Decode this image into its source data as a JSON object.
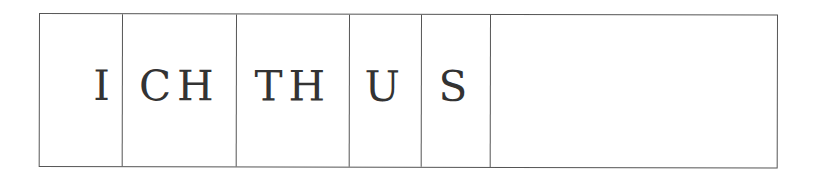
{
  "word": "ICHTHUS",
  "cells": [
    {
      "text": "I"
    },
    {
      "text": "CH"
    },
    {
      "text": "TH"
    },
    {
      "text": "U"
    },
    {
      "text": "S"
    },
    {
      "text": ""
    }
  ],
  "colors": {
    "border": "#555555",
    "text": "#333333",
    "background": "#ffffff"
  }
}
